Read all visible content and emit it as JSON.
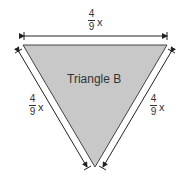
{
  "figure": {
    "title": "Triangle B",
    "fill_color": "#c8c8c8",
    "stroke_color": "#333333",
    "sides": {
      "top": {
        "numerator": "4",
        "denominator": "9",
        "variable": "x"
      },
      "left": {
        "numerator": "4",
        "denominator": "9",
        "variable": "x"
      },
      "right": {
        "numerator": "4",
        "denominator": "9",
        "variable": "x"
      }
    }
  }
}
